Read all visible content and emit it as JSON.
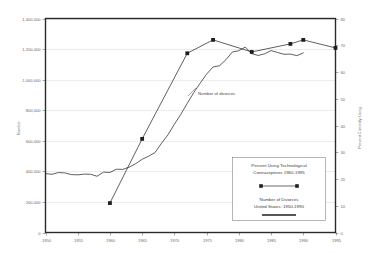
{
  "figure": {
    "faint_header": "",
    "background_color": "#ffffff",
    "line_color": "#2b2b2b"
  },
  "annotation": {
    "divorces_label": "Number of divorces"
  },
  "legend": {
    "series1_line1": "Percent Using Technological",
    "series1_line2": "Contraceptives 1960-1995",
    "series2_line1": "Number of Divorces",
    "series2_line2": "United States: 1950-1990"
  },
  "chart_data": {
    "type": "line",
    "title": "",
    "xlabel": "",
    "ylabel": "Number",
    "y2label": "Percent Currently Using",
    "xlim": [
      1950,
      1995
    ],
    "ylim": [
      0,
      1400000
    ],
    "y2lim": [
      0,
      80
    ],
    "grid": true,
    "legend_position": "inside-lower-right",
    "x_ticks": [
      1950,
      1955,
      1960,
      1965,
      1970,
      1975,
      1980,
      1985,
      1990,
      1995
    ],
    "x_tick_labels": [
      "1950",
      "1955",
      "1960",
      "1965",
      "1970",
      "1975",
      "1980",
      "1985",
      "1990",
      "1995"
    ],
    "y_ticks": [
      0,
      200000,
      400000,
      600000,
      800000,
      1000000,
      1200000,
      1400000
    ],
    "y_tick_labels": [
      "0",
      "200,000",
      "400,000",
      "600,000",
      "800,000",
      "1,000,000",
      "1,200,000",
      "1,400,000"
    ],
    "y2_ticks": [
      0,
      10,
      20,
      30,
      40,
      50,
      60,
      70,
      80
    ],
    "y2_tick_labels": [
      "0",
      "10",
      "20",
      "30",
      "40",
      "50",
      "60",
      "70",
      "80"
    ],
    "series": [
      {
        "name": "Number of Divorces",
        "axis": "left",
        "units": "divorces",
        "markers": false,
        "x": [
          1950,
          1951,
          1952,
          1953,
          1954,
          1955,
          1956,
          1957,
          1958,
          1959,
          1960,
          1961,
          1962,
          1963,
          1964,
          1965,
          1966,
          1967,
          1968,
          1969,
          1970,
          1971,
          1972,
          1973,
          1974,
          1975,
          1976,
          1977,
          1978,
          1979,
          1980,
          1981,
          1982,
          1983,
          1984,
          1985,
          1986,
          1987,
          1988,
          1989,
          1990
        ],
        "values": [
          385000,
          381000,
          392000,
          390000,
          379000,
          377000,
          382000,
          381000,
          368000,
          395000,
          393000,
          414000,
          413000,
          428000,
          450000,
          479000,
          499000,
          523000,
          584000,
          639000,
          708000,
          773000,
          845000,
          915000,
          977000,
          1036000,
          1083000,
          1091000,
          1130000,
          1181000,
          1189000,
          1213000,
          1170000,
          1158000,
          1169000,
          1190000,
          1178000,
          1166000,
          1167000,
          1157000,
          1175000
        ]
      },
      {
        "name": "Percent Using Technological Contraceptives",
        "axis": "right",
        "units": "percent",
        "markers": true,
        "x": [
          1960,
          1965,
          1972,
          1976,
          1982,
          1988,
          1990,
          1995
        ],
        "values": [
          11,
          35,
          67,
          72,
          67.5,
          70.5,
          72,
          69
        ]
      }
    ]
  }
}
